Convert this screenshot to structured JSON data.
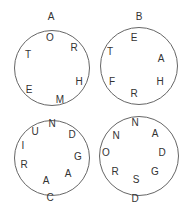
{
  "puzzles": [
    {
      "label": "A",
      "label_pos": [
        51,
        17
      ],
      "circle": {
        "cx": 51.5,
        "cy": 67.5,
        "r": 38
      },
      "letters": [
        {
          "ch": "O",
          "x": 50,
          "y": 38
        },
        {
          "ch": "R",
          "x": 74,
          "y": 48
        },
        {
          "ch": "T",
          "x": 28,
          "y": 55
        },
        {
          "ch": "H",
          "x": 79,
          "y": 82
        },
        {
          "ch": "E",
          "x": 29,
          "y": 90
        },
        {
          "ch": "M",
          "x": 60,
          "y": 100
        }
      ]
    },
    {
      "label": "B",
      "label_pos": [
        139,
        17
      ],
      "circle": {
        "cx": 139,
        "cy": 66,
        "r": 39
      },
      "letters": [
        {
          "ch": "E",
          "x": 134,
          "y": 38
        },
        {
          "ch": "T",
          "x": 110,
          "y": 52
        },
        {
          "ch": "A",
          "x": 161,
          "y": 59
        },
        {
          "ch": "F",
          "x": 112,
          "y": 82
        },
        {
          "ch": "H",
          "x": 160,
          "y": 82
        },
        {
          "ch": "R",
          "x": 134,
          "y": 94
        }
      ]
    },
    {
      "label": "C",
      "label_pos": [
        50,
        198
      ],
      "circle": {
        "cx": 51.5,
        "cy": 158,
        "r": 38
      },
      "letters": [
        {
          "ch": "N",
          "x": 52,
          "y": 124
        },
        {
          "ch": "U",
          "x": 35,
          "y": 132
        },
        {
          "ch": "D",
          "x": 72,
          "y": 135
        },
        {
          "ch": "I",
          "x": 23,
          "y": 146
        },
        {
          "ch": "G",
          "x": 78,
          "y": 157
        },
        {
          "ch": "R",
          "x": 24,
          "y": 165
        },
        {
          "ch": "A",
          "x": 68,
          "y": 174
        },
        {
          "ch": "A",
          "x": 46,
          "y": 181
        }
      ]
    },
    {
      "label": "D",
      "label_pos": [
        135,
        199
      ],
      "circle": {
        "cx": 139,
        "cy": 156,
        "r": 40
      },
      "letters": [
        {
          "ch": "N",
          "x": 135,
          "y": 123
        },
        {
          "ch": "N",
          "x": 116,
          "y": 136
        },
        {
          "ch": "A",
          "x": 155,
          "y": 134
        },
        {
          "ch": "O",
          "x": 106,
          "y": 153
        },
        {
          "ch": "D",
          "x": 162,
          "y": 153
        },
        {
          "ch": "R",
          "x": 115,
          "y": 172
        },
        {
          "ch": "G",
          "x": 155,
          "y": 172
        },
        {
          "ch": "S",
          "x": 136,
          "y": 180
        }
      ]
    }
  ]
}
